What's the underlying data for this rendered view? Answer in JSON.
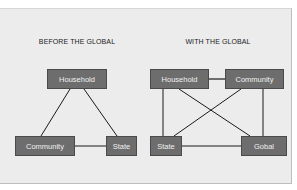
{
  "diagrams": [
    {
      "title": "BEFORE THE GLOBAL",
      "nodes": {
        "household": "Household",
        "community": "Community",
        "state": "State"
      },
      "edges": [
        [
          "household",
          "community"
        ],
        [
          "household",
          "state"
        ],
        [
          "community",
          "state"
        ]
      ]
    },
    {
      "title": "WITH THE GLOBAL",
      "nodes": {
        "household": "Household",
        "community": "Community",
        "state": "State",
        "global": "Gobal"
      },
      "edges": [
        [
          "household",
          "community"
        ],
        [
          "household",
          "state"
        ],
        [
          "household",
          "global"
        ],
        [
          "community",
          "state"
        ],
        [
          "community",
          "global"
        ],
        [
          "state",
          "global"
        ]
      ]
    }
  ],
  "colors": {
    "panel_bg": "#ececec",
    "node_fill": "#6d6d6d",
    "node_text": "#f0f0f0",
    "edge": "#1a1a1a"
  }
}
